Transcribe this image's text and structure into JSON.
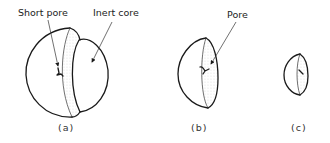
{
  "figure": {
    "panels": [
      {
        "id": "a",
        "caption": "(a)",
        "labels": [
          "Short pore",
          "Inert core"
        ]
      },
      {
        "id": "b",
        "caption": "(b)",
        "labels": [
          "Pore"
        ]
      },
      {
        "id": "c",
        "caption": "(c)",
        "labels": []
      }
    ],
    "labels": {
      "short_pore": "Short pore",
      "inert_core": "Inert core",
      "pore": "Pore"
    },
    "captions": {
      "a": "(a)",
      "b": "(b)",
      "c": "(c)"
    }
  }
}
